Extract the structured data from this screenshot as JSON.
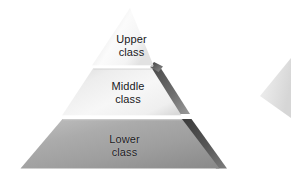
{
  "diagram": {
    "type": "pyramid",
    "background_color": "#ffffff",
    "tiers": [
      {
        "id": "upper",
        "line1": "Upper",
        "line2": "class",
        "fill_light": "#fdfdfd",
        "fill_dark": "#d8d8d8",
        "shadow_color": "#5a5a5a",
        "rank": 1
      },
      {
        "id": "middle",
        "line1": "Middle",
        "line2": "class",
        "fill_light": "#f4f4f4",
        "fill_dark": "#cfcfcf",
        "shadow_color": "#5f5f5f",
        "rank": 2
      },
      {
        "id": "lower",
        "line1": "Lower",
        "line2": "class",
        "fill_light": "#b6b6b6",
        "fill_dark": "#8e8e8e",
        "shadow_color": "#4a4a4a",
        "rank": 3
      }
    ],
    "secondary_shape": {
      "id": "partial-pyramid-right",
      "fill": "#e6e6e6",
      "description": "faint partial pyramid at right edge"
    },
    "text_color": "#17171a"
  }
}
